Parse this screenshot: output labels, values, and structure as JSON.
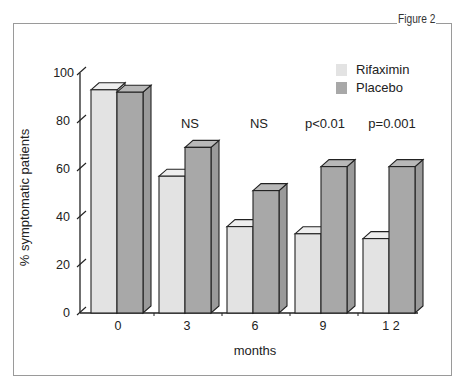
{
  "figure": {
    "label": "Figure 2"
  },
  "chart_data": {
    "type": "bar",
    "title": "",
    "xlabel": "months",
    "ylabel": "% symptomatic patients",
    "categories": [
      "0",
      "3",
      "6",
      "9",
      "1 2"
    ],
    "series": [
      {
        "name": "Rifaximin",
        "color": "#e3e3e3",
        "values": [
          93,
          57,
          36,
          33,
          31
        ]
      },
      {
        "name": "Placebo",
        "color": "#a8a8a8",
        "values": [
          92,
          69,
          51,
          61,
          61
        ]
      }
    ],
    "annotations": [
      "",
      "NS",
      "NS",
      "p<0.01",
      "p=0.001"
    ],
    "yticks": [
      "0",
      "20",
      "40",
      "60",
      "80",
      "100"
    ],
    "ylim": [
      0,
      100
    ],
    "grid": false,
    "legend_position": "top-right",
    "style": "3d-bar"
  }
}
